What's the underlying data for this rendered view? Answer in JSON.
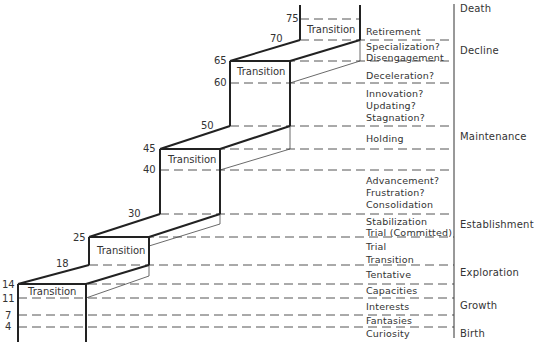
{
  "diagram": {
    "transition_label": "Transition",
    "ages": {
      "a4": "4",
      "a7": "7",
      "a11": "11",
      "a14": "14",
      "a18": "18",
      "a25": "25",
      "a30": "30",
      "a40": "40",
      "a45": "45",
      "a50": "50",
      "a60": "60",
      "a65": "65",
      "a70": "70",
      "a75": "75"
    },
    "transitions": [
      {
        "label": "Transition",
        "from_age": "11",
        "to_age": "14"
      },
      {
        "label": "Transition",
        "from_age": "18",
        "to_age": "25"
      },
      {
        "label": "Transition",
        "from_age": "40",
        "to_age": "45"
      },
      {
        "label": "Transition",
        "from_age": "60",
        "to_age": "65"
      },
      {
        "label": "Transition",
        "from_age": "70",
        "to_age": "75"
      }
    ],
    "events": [
      "Retirement",
      "Specialization?",
      "Disengagement",
      "Deceleration?",
      "Innovation?",
      "Updating?",
      "Stagnation?",
      "Holding",
      "Advancement?",
      "Frustration?",
      "Consolidation",
      "Stabilization",
      "Trial (Committed)",
      "Trial",
      "Transition",
      "Tentative",
      "Capacities",
      "Interests",
      "Fantasies",
      "Curiosity"
    ],
    "stages": [
      "Death",
      "Decline",
      "Maintenance",
      "Establishment",
      "Exploration",
      "Growth",
      "Birth"
    ]
  }
}
